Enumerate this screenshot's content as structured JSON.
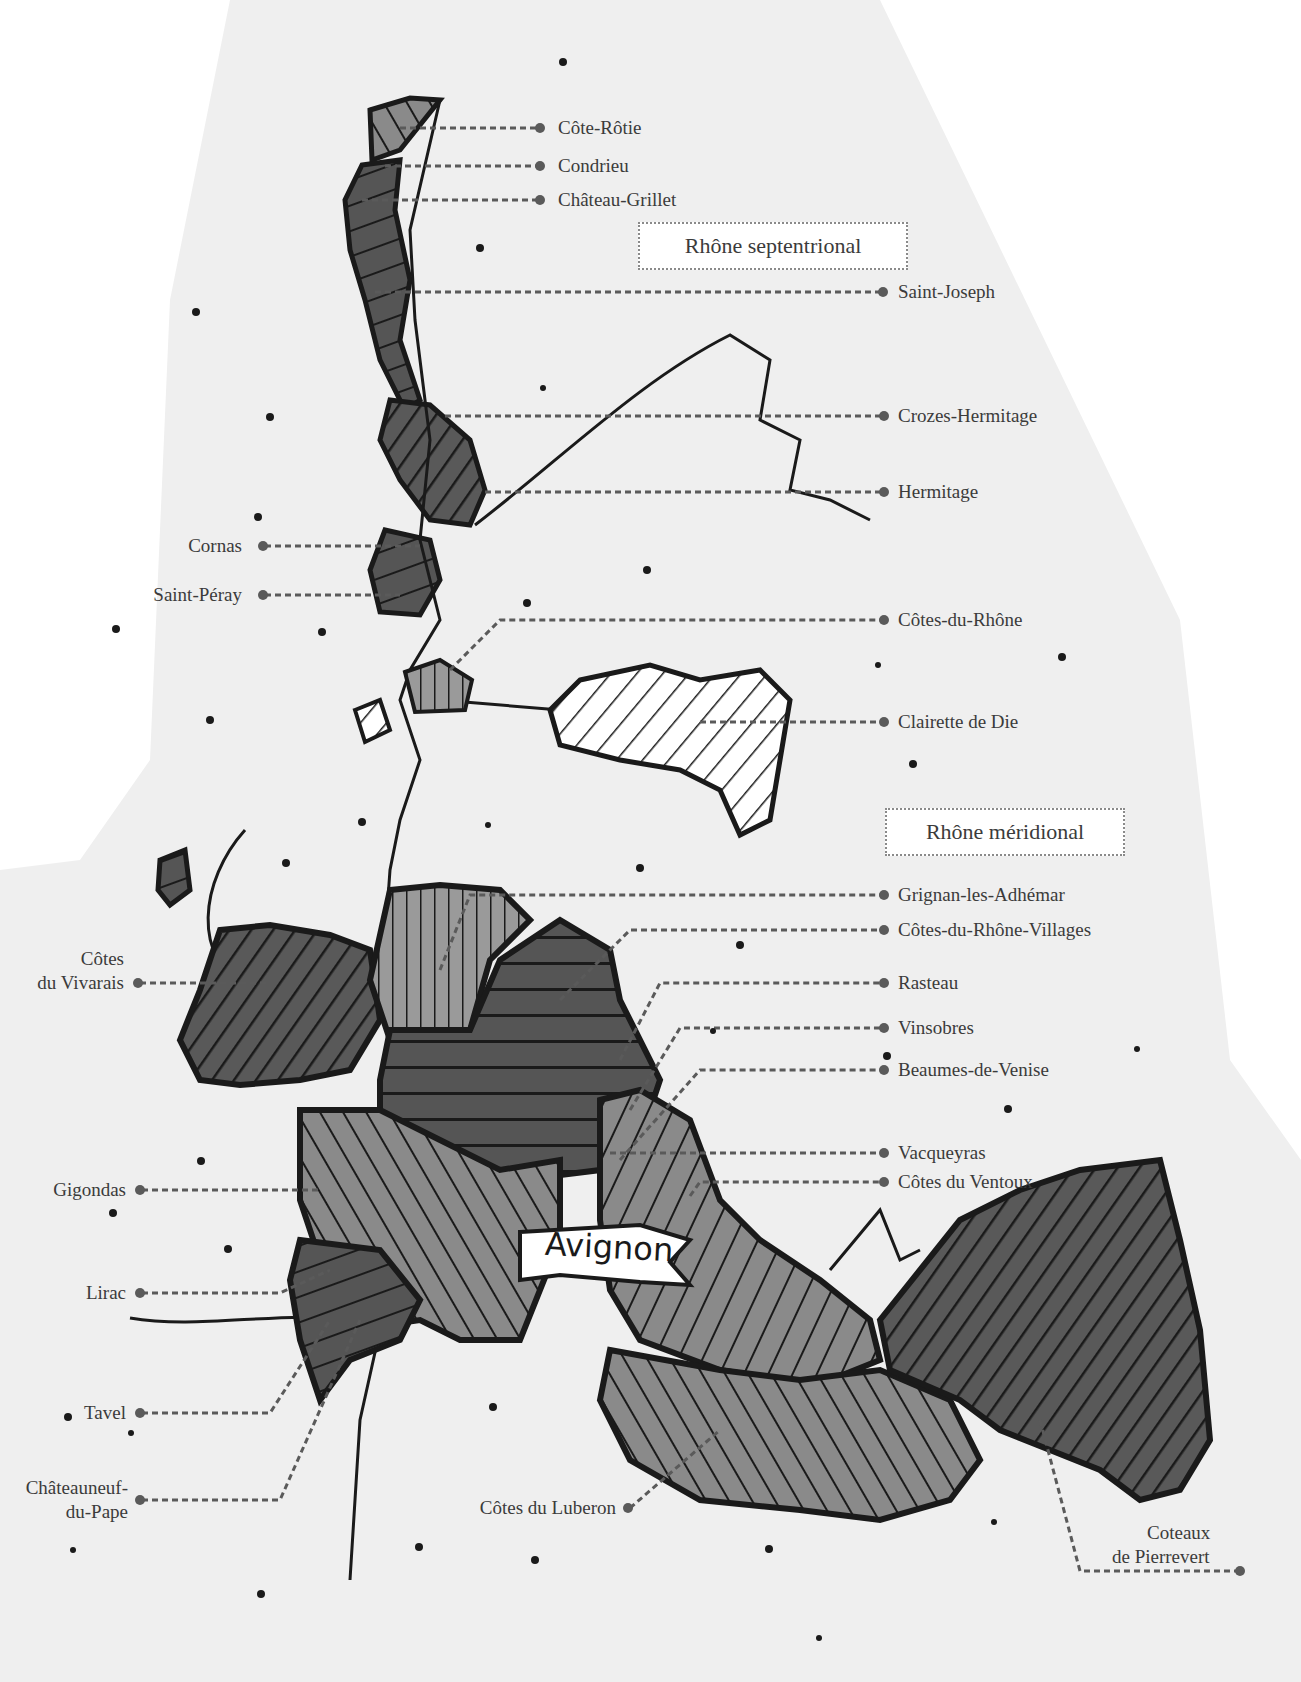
{
  "map": {
    "title": "Rhône wine regions",
    "colors": {
      "land": "#efefef",
      "dark_fill": "#595959",
      "mid_fill": "#8a8a8a",
      "light_fill": "#ffffff",
      "outline": "#1a1a1a",
      "leader": "#5a5a5a"
    },
    "region_boxes": [
      {
        "id": "north",
        "label": "Rhône septentrional"
      },
      {
        "id": "south",
        "label": "Rhône méridional"
      }
    ],
    "city": {
      "label": "Avignon"
    },
    "appellations_right": [
      {
        "label": "Côte-Rôtie"
      },
      {
        "label": "Condrieu"
      },
      {
        "label": "Château-Grillet"
      },
      {
        "label": "Saint-Joseph"
      },
      {
        "label": "Crozes-Hermitage"
      },
      {
        "label": "Hermitage"
      },
      {
        "label": "Côtes-du-Rhône"
      },
      {
        "label": "Clairette de Die"
      },
      {
        "label": "Grignan-les-Adhémar"
      },
      {
        "label": "Côtes-du-Rhône-Villages"
      },
      {
        "label": "Rasteau"
      },
      {
        "label": "Vinsobres"
      },
      {
        "label": "Beaumes-de-Venise"
      },
      {
        "label": "Vacqueyras"
      },
      {
        "label": "Côtes du Ventoux"
      }
    ],
    "appellations_left": [
      {
        "label": "Cornas"
      },
      {
        "label": "Saint-Péray"
      },
      {
        "label": "Côtes"
      },
      {
        "label": "du Vivarais"
      },
      {
        "label": "Gigondas"
      },
      {
        "label": "Lirac"
      },
      {
        "label": "Tavel"
      },
      {
        "label": "Châteauneuf-"
      },
      {
        "label": "du-Pape"
      }
    ],
    "appellations_bottom": [
      {
        "label": "Côtes du Luberon"
      },
      {
        "label": "Coteaux"
      },
      {
        "label": "de Pierrevert"
      }
    ]
  }
}
